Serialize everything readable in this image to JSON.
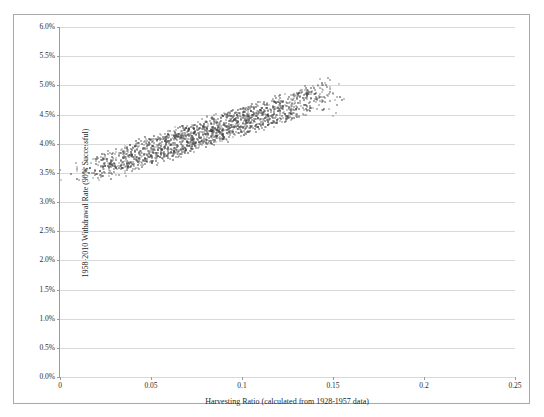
{
  "chart_data": {
    "type": "scatter",
    "title": "",
    "xlabel": "Harvesting Ratio (calculated from 1928-1957 data)",
    "ylabel": "1958-2010 Withdrawal Rate (90% Successful)",
    "xlim": [
      0,
      0.25
    ],
    "ylim": [
      0,
      0.06
    ],
    "grid": true,
    "legend": false,
    "xticks": [
      0,
      0.05,
      0.1,
      0.15,
      0.2,
      0.25
    ],
    "xticklabels": [
      "0",
      "0.05",
      "0.1",
      "0.15",
      "0.2",
      "0.25"
    ],
    "yticks": [
      0,
      0.005,
      0.01,
      0.015,
      0.02,
      0.025,
      0.03,
      0.035,
      0.04,
      0.045,
      0.05,
      0.055,
      0.06
    ],
    "yticklabels": [
      "0.0%",
      "0.5%",
      "1.0%",
      "1.5%",
      "2.0%",
      "2.5%",
      "3.0%",
      "3.5%",
      "4.0%",
      "4.5%",
      "5.0%",
      "5.5%",
      "6.0%"
    ],
    "marker_color": "#3a3a3a",
    "grid_color": "#d9d9d9",
    "axis_color": "#9a9a9a",
    "border_color": "#a8a8a8",
    "series": [
      {
        "name": "Withdrawal rate vs harvesting ratio",
        "x": [
          0.004,
          0.01,
          0.013,
          0.016,
          0.018,
          0.019,
          0.021,
          0.022,
          0.023,
          0.024,
          0.025,
          0.026,
          0.027,
          0.028,
          0.029,
          0.03,
          0.031,
          0.032,
          0.033,
          0.034,
          0.035,
          0.036,
          0.037,
          0.038,
          0.039,
          0.04,
          0.041,
          0.042,
          0.043,
          0.044,
          0.045,
          0.046,
          0.047,
          0.048,
          0.049,
          0.05,
          0.051,
          0.052,
          0.053,
          0.054,
          0.055,
          0.056,
          0.057,
          0.058,
          0.059,
          0.06,
          0.061,
          0.062,
          0.063,
          0.064,
          0.065,
          0.066,
          0.067,
          0.068,
          0.069,
          0.07,
          0.071,
          0.072,
          0.073,
          0.074,
          0.075,
          0.076,
          0.077,
          0.078,
          0.079,
          0.08,
          0.081,
          0.082,
          0.083,
          0.084,
          0.085,
          0.086,
          0.087,
          0.088,
          0.089,
          0.09,
          0.091,
          0.092,
          0.093,
          0.094,
          0.095,
          0.096,
          0.097,
          0.098,
          0.099,
          0.1,
          0.101,
          0.102,
          0.103,
          0.104,
          0.105,
          0.106,
          0.107,
          0.108,
          0.109,
          0.11,
          0.111,
          0.112,
          0.113,
          0.114,
          0.115,
          0.116,
          0.117,
          0.118,
          0.119,
          0.12,
          0.121,
          0.122,
          0.123,
          0.124,
          0.125,
          0.126,
          0.127,
          0.128,
          0.129,
          0.13,
          0.131,
          0.132,
          0.133,
          0.134,
          0.135,
          0.136,
          0.137,
          0.138,
          0.139,
          0.14,
          0.141,
          0.142,
          0.143,
          0.144,
          0.145,
          0.146,
          0.147,
          0.148,
          0.15,
          0.152,
          0.155
        ],
        "y": [
          0.0348,
          0.0352,
          0.035,
          0.0355,
          0.0353,
          0.0358,
          0.0356,
          0.036,
          0.0359,
          0.0362,
          0.0358,
          0.0365,
          0.0361,
          0.0367,
          0.0363,
          0.037,
          0.0366,
          0.0372,
          0.0368,
          0.0374,
          0.037,
          0.0376,
          0.0372,
          0.0378,
          0.0375,
          0.038,
          0.0377,
          0.0382,
          0.0379,
          0.0384,
          0.0381,
          0.0386,
          0.0383,
          0.0388,
          0.0385,
          0.039,
          0.0387,
          0.0392,
          0.0389,
          0.0394,
          0.0391,
          0.0396,
          0.0393,
          0.0398,
          0.0395,
          0.04,
          0.0397,
          0.0402,
          0.0399,
          0.0404,
          0.0401,
          0.0406,
          0.0403,
          0.0408,
          0.0405,
          0.041,
          0.0407,
          0.0412,
          0.0409,
          0.0414,
          0.0411,
          0.0416,
          0.0413,
          0.0418,
          0.0415,
          0.042,
          0.0417,
          0.0422,
          0.0419,
          0.0424,
          0.0421,
          0.0426,
          0.0423,
          0.0428,
          0.0425,
          0.043,
          0.0427,
          0.0432,
          0.0429,
          0.0434,
          0.0431,
          0.0436,
          0.0433,
          0.0438,
          0.0435,
          0.044,
          0.0437,
          0.0442,
          0.0439,
          0.0444,
          0.0441,
          0.0446,
          0.0443,
          0.0448,
          0.0445,
          0.045,
          0.0447,
          0.0452,
          0.0449,
          0.0454,
          0.0451,
          0.0456,
          0.0453,
          0.0458,
          0.0455,
          0.046,
          0.0457,
          0.0462,
          0.0459,
          0.0464,
          0.0461,
          0.0466,
          0.0463,
          0.0468,
          0.0465,
          0.047,
          0.0467,
          0.0472,
          0.0469,
          0.0474,
          0.0471,
          0.0476,
          0.0473,
          0.0478,
          0.0475,
          0.048,
          0.0477,
          0.0485,
          0.0479,
          0.049,
          0.0482,
          0.0495,
          0.0484,
          0.05,
          0.0472,
          0.0468,
          0.0465
        ],
        "n_points": 137,
        "cloud_note": "dense ascending band of small dark markers, spread approx +/-0.0025 vertically, densest between x=0.06 and x=0.13"
      }
    ]
  }
}
